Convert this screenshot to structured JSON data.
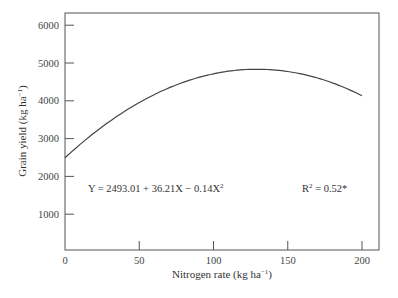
{
  "chart_data": {
    "type": "line",
    "title": "",
    "xlabel": "Nitrogen rate (kg ha⁻¹)",
    "ylabel": "Grain yield (kg ha⁻¹)",
    "xlim": [
      0,
      212
    ],
    "ylim": [
      0,
      6300
    ],
    "xticks": [
      0,
      50,
      100,
      150,
      200
    ],
    "yticks": [
      1000,
      2000,
      3000,
      4000,
      5000,
      6000
    ],
    "x_tick_labels": [
      "0",
      "50",
      "100",
      "150",
      "200"
    ],
    "y_tick_labels": [
      "1000",
      "2000",
      "3000",
      "4000",
      "5000",
      "6000"
    ],
    "grid": false,
    "legend": null,
    "series": [
      {
        "name": "Quadratic fit",
        "equation": {
          "intercept": 2493.01,
          "linear": 36.21,
          "quadratic": -0.14
        },
        "x": [
          0,
          25,
          50,
          75,
          100,
          125,
          150,
          175,
          200
        ],
        "values": [
          2493.01,
          3310.76,
          3953.51,
          4421.26,
          4714.01,
          4831.76,
          4774.51,
          4542.26,
          4135.01
        ]
      }
    ],
    "annotations": [
      {
        "text_main": "Y = 2493.01 + 36.21X − 0.14X",
        "sup": "2",
        "position": "lower-left"
      },
      {
        "text_main": "R",
        "sup": "2",
        "text_after": " = 0.52*",
        "position": "lower-right"
      }
    ]
  },
  "labels": {
    "xlabel": "Nitrogen rate (kg ha",
    "xlabel_sup": "−1",
    "xlabel_end": ")",
    "ylabel": "Grain yield (kg ha",
    "ylabel_sup": "−1",
    "ylabel_end": ")",
    "equation": "Y = 2493.01 + 36.21X − 0.14X",
    "equation_sup": "2",
    "r2_main": "R",
    "r2_sup": "2",
    "r2_after": " = 0.52*"
  }
}
